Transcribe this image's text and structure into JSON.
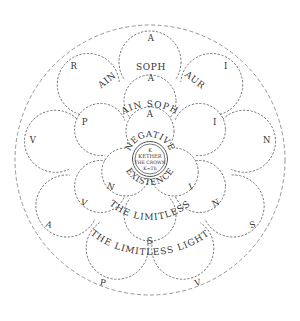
{
  "diagram": {
    "outer_ring_letters": [
      {
        "char": "A",
        "x": 151,
        "y": 38
      },
      {
        "char": "I",
        "x": 226,
        "y": 66
      },
      {
        "char": "N",
        "x": 267,
        "y": 140
      },
      {
        "char": "S",
        "x": 253,
        "y": 225
      },
      {
        "char": "V",
        "x": 198,
        "y": 283
      },
      {
        "char": "P",
        "x": 103,
        "y": 283
      },
      {
        "char": "A",
        "x": 49,
        "y": 225
      },
      {
        "char": "V",
        "x": 33,
        "y": 140
      },
      {
        "char": "R",
        "x": 74,
        "y": 66
      }
    ],
    "middle_ring_letters": [
      {
        "char": "A",
        "x": 151,
        "y": 78
      },
      {
        "char": "I",
        "x": 215,
        "y": 122
      },
      {
        "char": "N",
        "x": 216,
        "y": 203
      },
      {
        "char": "S",
        "x": 150,
        "y": 241
      },
      {
        "char": "V",
        "x": 84,
        "y": 203
      },
      {
        "char": "P",
        "x": 85,
        "y": 122
      }
    ],
    "inner_ring_letters": [
      {
        "char": "A",
        "x": 150,
        "y": 114
      },
      {
        "char": "I",
        "x": 191,
        "y": 187
      },
      {
        "char": "N",
        "x": 111,
        "y": 187
      }
    ],
    "outer_words": {
      "ain": "AIN",
      "soph": "SOPH",
      "aur": "AUR",
      "bottom_arc": "THE LIMITLESS LIGHT"
    },
    "middle_words": {
      "top_arc": "AIN SOPH",
      "bottom_arc": "THE LIMITLESS"
    },
    "inner_words": {
      "top_arc": "NEGATIVE",
      "bottom_arc": "EXISTENCE"
    },
    "kether": {
      "line1": "K",
      "line2": "KETHER",
      "line3": "THE CROWN",
      "line4": "K=Th"
    }
  }
}
